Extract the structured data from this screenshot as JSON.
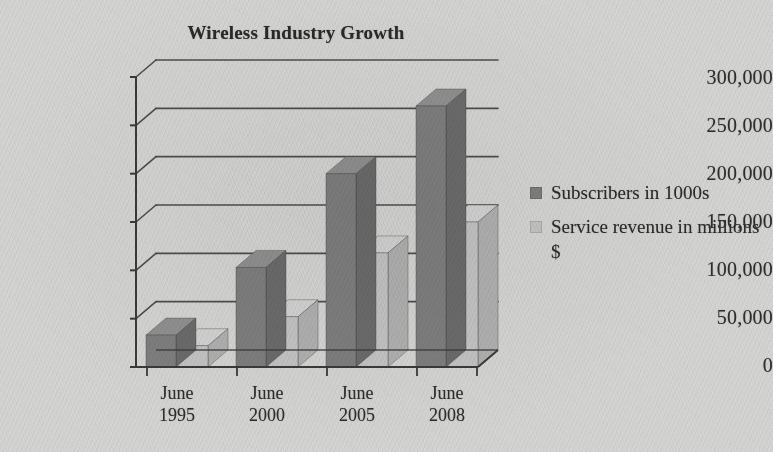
{
  "chart_data": {
    "type": "bar",
    "title": "Wireless Industry Growth",
    "xlabel": "",
    "ylabel": "",
    "categories": [
      "June 1995",
      "June 2000",
      "June 2005",
      "June 2008"
    ],
    "category_lines": [
      [
        "June",
        "1995"
      ],
      [
        "June",
        "2000"
      ],
      [
        "June",
        "2005"
      ],
      [
        "June",
        "2008"
      ]
    ],
    "series": [
      {
        "name": "Subscribers in 1000s",
        "color": "#7e7e7e",
        "values": [
          33000,
          103000,
          200000,
          270000
        ]
      },
      {
        "name": "Service revenue in millions $",
        "color": "#c3c3c3",
        "values": [
          22000,
          52000,
          118000,
          150000
        ]
      }
    ],
    "ylim": [
      0,
      300000
    ],
    "ytick_values": [
      0,
      50000,
      100000,
      150000,
      200000,
      250000,
      300000
    ],
    "ytick_labels": [
      "0",
      "50,000",
      "100,000",
      "150,000",
      "200,000",
      "250,000",
      "300,000"
    ],
    "grid": true,
    "legend_position": "right",
    "style": "3d-perspective-bar",
    "colors": {
      "background": "#d4d5d3",
      "axis": "#3a3a3a",
      "grid": "#3f3f3f",
      "text": "#2b2b2b",
      "series_dark": "#7e7e7e",
      "series_dark_side": "#6b6b6b",
      "series_dark_top": "#909090",
      "series_light": "#c3c3c3",
      "series_light_side": "#b0b0b0",
      "series_light_top": "#d2d2d2"
    }
  },
  "legend": {
    "items": [
      {
        "label": "Subscribers in 1000s"
      },
      {
        "label": "Service revenue in millions $"
      }
    ]
  }
}
